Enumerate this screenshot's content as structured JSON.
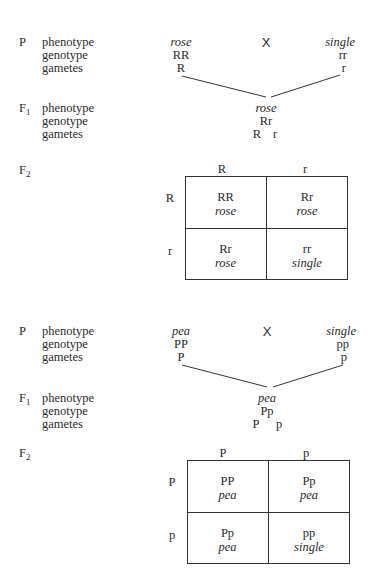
{
  "crosses": [
    {
      "name": "rose-cross",
      "row_labels": {
        "P": "P",
        "F1": "F",
        "F1_sub": "1",
        "F2": "F",
        "F2_sub": "2",
        "phenotype": "phenotype",
        "genotype": "genotype",
        "gametes": "gametes"
      },
      "parent1": {
        "phenotype": "rose",
        "genotype": "RR",
        "gamete": "R"
      },
      "cross_symbol": "X",
      "parent2": {
        "phenotype": "single",
        "genotype": "rr",
        "gamete": "r"
      },
      "f1": {
        "phenotype": "rose",
        "genotype": "Rr",
        "gametes": [
          "R",
          "r"
        ]
      },
      "punnett": {
        "col_headers": [
          "R",
          "r"
        ],
        "row_headers": [
          "R",
          "r"
        ],
        "cells": [
          [
            {
              "genotype": "RR",
              "phenotype": "rose"
            },
            {
              "genotype": "Rr",
              "phenotype": "rose"
            }
          ],
          [
            {
              "genotype": "Rr",
              "phenotype": "rose"
            },
            {
              "genotype": "rr",
              "phenotype": "single"
            }
          ]
        ]
      }
    },
    {
      "name": "pea-cross",
      "row_labels": {
        "P": "P",
        "F1": "F",
        "F1_sub": "1",
        "F2": "F",
        "F2_sub": "2",
        "phenotype": "phenotype",
        "genotype": "genotype",
        "gametes": "gametes"
      },
      "parent1": {
        "phenotype": "pea",
        "genotype": "PP",
        "gamete": "P"
      },
      "cross_symbol": "X",
      "parent2": {
        "phenotype": "single",
        "genotype": "pp",
        "gamete": "p"
      },
      "f1": {
        "phenotype": "pea",
        "genotype": "Pp",
        "gametes": [
          "P",
          "p"
        ]
      },
      "punnett": {
        "col_headers": [
          "P",
          "p"
        ],
        "row_headers": [
          "P",
          "p"
        ],
        "cells": [
          [
            {
              "genotype": "PP",
              "phenotype": "pea"
            },
            {
              "genotype": "Pp",
              "phenotype": "pea"
            }
          ],
          [
            {
              "genotype": "Pp",
              "phenotype": "pea"
            },
            {
              "genotype": "pp",
              "phenotype": "single"
            }
          ]
        ]
      }
    }
  ]
}
